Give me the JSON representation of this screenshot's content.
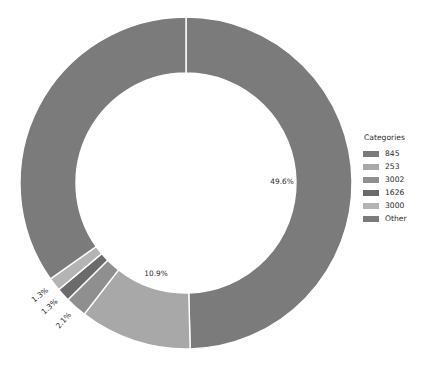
{
  "chart_data": {
    "type": "pie",
    "variant": "donut",
    "title": "",
    "xlabel": "",
    "ylabel": "",
    "legend_position": "right",
    "grid": false,
    "start_angle_deg": 0,
    "direction": "clockwise",
    "center": {
      "x": 186,
      "y": 183
    },
    "outer_radius": 166,
    "inner_radius": 110,
    "categories": [
      "845",
      "253",
      "3002",
      "1626",
      "3000",
      "Other"
    ],
    "values": [
      49.6,
      10.9,
      2.1,
      1.3,
      1.3,
      34.8
    ],
    "labels": [
      "49.6%",
      "10.9%",
      "2.1%",
      "1.3%",
      "1.3%",
      ""
    ],
    "colors": [
      "#7b7b7b",
      "#a8a8a8",
      "#8f8f8f",
      "#6b6b6b",
      "#b4b4b4",
      "#7b7b7b"
    ],
    "slices": [
      {
        "name": "845",
        "value": 49.6,
        "label": "49.6%",
        "color": "#7b7b7b",
        "label_shown": true
      },
      {
        "name": "253",
        "value": 10.9,
        "label": "10.9%",
        "color": "#a8a8a8",
        "label_shown": true
      },
      {
        "name": "3002",
        "value": 2.1,
        "label": "2.1%",
        "color": "#8f8f8f",
        "label_shown": true
      },
      {
        "name": "1626",
        "value": 1.3,
        "label": "1.3%",
        "color": "#6b6b6b",
        "label_shown": true
      },
      {
        "name": "3000",
        "value": 1.3,
        "label": "1.3%",
        "color": "#b4b4b4",
        "label_shown": true
      },
      {
        "name": "Other",
        "value": 34.8,
        "label": "",
        "color": "#7b7b7b",
        "label_shown": false
      }
    ]
  },
  "legend": {
    "title": "Categories",
    "items": [
      {
        "label": "845",
        "color": "#7b7b7b"
      },
      {
        "label": "253",
        "color": "#a8a8a8"
      },
      {
        "label": "3002",
        "color": "#8f8f8f"
      },
      {
        "label": "1626",
        "color": "#6b6b6b"
      },
      {
        "label": "3000",
        "color": "#b4b4b4"
      },
      {
        "label": "Other",
        "color": "#7b7b7b"
      }
    ]
  },
  "slice_labels": {
    "l0": "49.6%",
    "l1": "10.9%",
    "l2": "2.1%",
    "l3": "1.3%",
    "l4": "1.3%"
  },
  "style": {
    "background": "#ffffff",
    "divider": "#ffffff",
    "text": "#2b2b2b"
  }
}
